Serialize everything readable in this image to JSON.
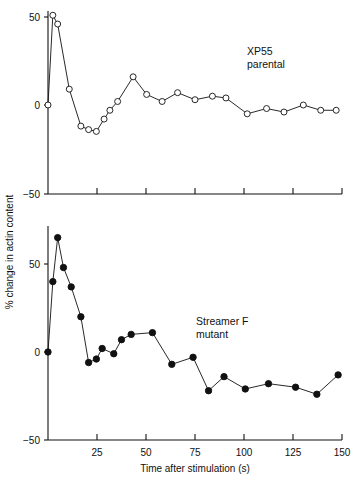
{
  "figure": {
    "ylabel": "% change in actin content",
    "xlabel": "Time after stimulation  (s)",
    "xticks": [
      0,
      25,
      50,
      75,
      100,
      125,
      150
    ],
    "xticklabels": [
      "",
      "25",
      "50",
      "75",
      "100",
      "125",
      "150"
    ],
    "yticks": [
      50,
      0,
      -50
    ],
    "yticklabels": [
      "50",
      "0",
      "−50"
    ],
    "xlim": [
      0,
      152
    ],
    "ylim": [
      -50,
      72
    ],
    "grid": false,
    "line_color": "#111111",
    "background": "#ffffff"
  },
  "chart_data": [
    {
      "type": "line",
      "title": "XP55\nparental",
      "label_line1": "XP55",
      "label_line2": "parental",
      "panel": "top",
      "marker": "open-circle",
      "xlabel": "",
      "ylabel": "% change in actin content",
      "xlim": [
        0,
        152
      ],
      "ylim": [
        -50,
        72
      ],
      "x": [
        0,
        2.5,
        5,
        11,
        17,
        21,
        25,
        29,
        32,
        36,
        44,
        51,
        59,
        67,
        76,
        85,
        92,
        103,
        113,
        122,
        132,
        141,
        149
      ],
      "y": [
        0,
        51,
        46,
        9,
        -12,
        -14,
        -15,
        -8,
        -3,
        2,
        16,
        6,
        2,
        7,
        3,
        5,
        4,
        -5,
        -2,
        -4,
        0,
        -3,
        -3
      ]
    },
    {
      "type": "line",
      "title": "Streamer F\nmutant",
      "label_line1": "Streamer F",
      "label_line2": "mutant",
      "panel": "bottom",
      "marker": "filled-circle",
      "xlabel": "Time after stimulation  (s)",
      "ylabel": "% change in actin content",
      "xlim": [
        0,
        152
      ],
      "ylim": [
        -50,
        72
      ],
      "x": [
        0,
        2.5,
        5,
        8,
        12,
        17,
        21,
        25,
        28,
        34,
        38,
        43,
        54,
        64,
        75,
        83,
        91,
        102,
        114,
        128,
        139,
        150
      ],
      "y": [
        0,
        40,
        65,
        48,
        37,
        20,
        -6,
        -4,
        2,
        -1,
        7,
        10,
        11,
        -7,
        -3,
        -22,
        -14,
        -21,
        -18,
        -20,
        -24,
        -13,
        -26
      ]
    }
  ]
}
